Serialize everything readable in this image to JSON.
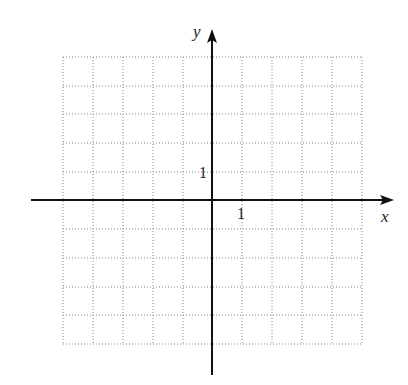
{
  "graph": {
    "x_axis_label": "x",
    "y_axis_label": "y",
    "x_tick_label": "1",
    "y_tick_label": "1",
    "grid": {
      "x_min": -5,
      "x_max": 5,
      "y_min": -5,
      "y_max": 5,
      "step": 1,
      "style": "dotted"
    },
    "colors": {
      "axis": "#111111",
      "grid": "#888888",
      "background": "#ffffff"
    }
  }
}
